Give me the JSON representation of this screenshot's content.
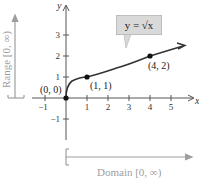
{
  "figure": {
    "function_label": "y = √x",
    "axis_x_label": "x",
    "axis_y_label": "y",
    "x_ticks": [
      "−1",
      "1",
      "2",
      "3",
      "4",
      "5"
    ],
    "y_ticks": [
      "3",
      "2",
      "1",
      "−1"
    ],
    "points": [
      {
        "label": "(0, 0)",
        "x": 0,
        "y": 0
      },
      {
        "label": "(1, 1)",
        "x": 1,
        "y": 1
      },
      {
        "label": "(4, 2)",
        "x": 4,
        "y": 2
      }
    ],
    "range_label": "Range [0, ∞)",
    "domain_label": "Domain [0, ∞)",
    "colors": {
      "axis": "#555555",
      "curve": "#333333",
      "bracket": "#9e9e9e",
      "bracket_text": "#a0a0a0",
      "callout_fill": "#d9d9d9"
    }
  }
}
